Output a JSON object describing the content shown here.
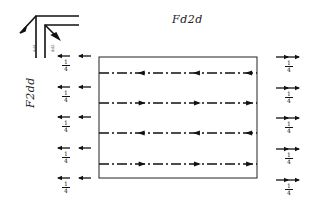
{
  "labels": {
    "top": "Fd2d",
    "side": "F2dd",
    "corner_left": "ddd",
    "corner_right": "dd2"
  },
  "fraction": {
    "num": "1",
    "den": "4"
  },
  "diagram": {
    "rectangle": {
      "x": 99,
      "y": 57,
      "width": 158,
      "height": 121
    },
    "flow_lines": [
      {
        "y": 73,
        "direction": "left"
      },
      {
        "y": 103,
        "direction": "right"
      },
      {
        "y": 133,
        "direction": "left"
      },
      {
        "y": 164,
        "direction": "right"
      }
    ],
    "left_arrow_rows": [
      56,
      87,
      117,
      148,
      178
    ],
    "right_arrow_rows": [
      57,
      88,
      118,
      149,
      180
    ],
    "line_color": "#111111"
  }
}
